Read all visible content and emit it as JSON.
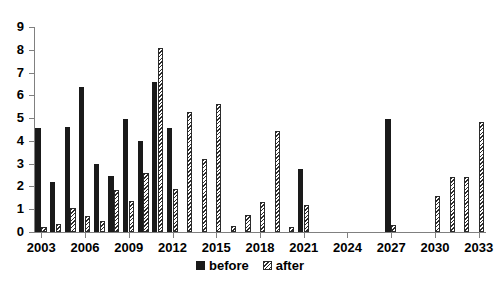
{
  "chart_data": {
    "type": "bar",
    "title": "",
    "subtitle": "",
    "xlabel": "",
    "ylabel": "",
    "ylim": [
      0,
      9
    ],
    "ytick_labels": [
      "0",
      "1",
      "2",
      "3",
      "4",
      "5",
      "6",
      "7",
      "8",
      "9"
    ],
    "ytick_values": [
      0,
      1,
      2,
      3,
      4,
      5,
      6,
      7,
      8,
      9
    ],
    "grid": false,
    "legend_position": "bottom",
    "categories": [
      "2003",
      "2004",
      "2005",
      "2006",
      "2007",
      "2008",
      "2009",
      "2010",
      "2011",
      "2012",
      "2013",
      "2014",
      "2015",
      "2016",
      "2017",
      "2018",
      "2019",
      "2020",
      "2021",
      "2022",
      "2023",
      "2024",
      "2025",
      "2026",
      "2027",
      "2028",
      "2029",
      "2030",
      "2031",
      "2032",
      "2033"
    ],
    "xtick_labels": [
      "2003",
      "2006",
      "2009",
      "2012",
      "2015",
      "2018",
      "2021",
      "2024",
      "2027",
      "2030",
      "2033"
    ],
    "series": [
      {
        "name": "before",
        "color": "#1a1a1a",
        "fill": "solid",
        "values": [
          4.55,
          2.2,
          4.6,
          6.35,
          3.0,
          2.45,
          4.95,
          4.0,
          6.6,
          4.55,
          0.0,
          0.0,
          0.0,
          0.0,
          0.0,
          0.0,
          0.0,
          0.0,
          2.75,
          0.0,
          0.0,
          0.0,
          0.0,
          0.0,
          4.95,
          0.0,
          0.0,
          0.0,
          0.0,
          0.0,
          0.0
        ]
      },
      {
        "name": "after",
        "color": "#2b2b2b",
        "fill": "diagonal-hatch",
        "values": [
          0.2,
          0.35,
          1.05,
          0.7,
          0.5,
          1.85,
          1.35,
          2.6,
          8.1,
          1.9,
          5.25,
          3.2,
          5.6,
          0.25,
          0.75,
          1.3,
          4.45,
          0.2,
          1.2,
          0.0,
          0.0,
          0.0,
          0.0,
          0.0,
          0.3,
          0.0,
          0.0,
          1.6,
          2.4,
          2.4,
          4.85
        ]
      }
    ]
  },
  "legend": {
    "items": [
      {
        "label": "before",
        "marker": "solid-square-marker"
      },
      {
        "label": "after",
        "marker": "hatched-square-marker"
      }
    ]
  }
}
